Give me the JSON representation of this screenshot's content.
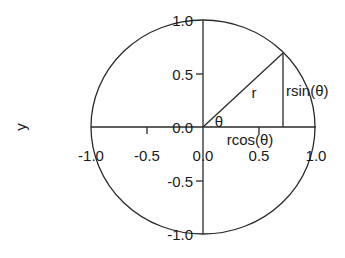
{
  "diagram": {
    "ylabel": "y",
    "y_ticks": [
      "1.0",
      "0.5",
      "0.0",
      "-0.5",
      "-1.0"
    ],
    "x_ticks": [
      "-1.0",
      "-0.5",
      "0.0",
      "0.5",
      "1.0"
    ],
    "annotations": {
      "radius": "r",
      "angle": "θ",
      "vertical": "rsin(θ)",
      "horizontal": "rcos(θ)"
    },
    "point": {
      "theta_deg": 45,
      "x": 0.707,
      "y": 0.707
    },
    "colors": {
      "line": "#2a2a2a",
      "text": "#1a1a1a",
      "background": "#ffffff"
    }
  }
}
